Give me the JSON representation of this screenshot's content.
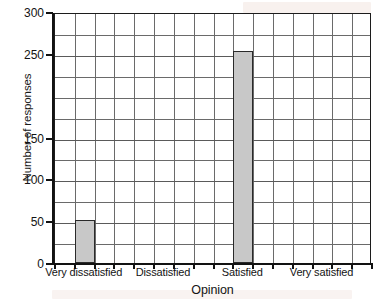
{
  "chart_data": {
    "type": "bar",
    "title": "",
    "xlabel": "Opinion",
    "ylabel": "Number of responses",
    "categories": [
      "Very dissatisfied",
      "Dissatisfied",
      "Satisfied",
      "Very satisfied"
    ],
    "values": [
      51,
      0,
      253,
      0
    ],
    "ylim": [
      0,
      300
    ],
    "y_tick_step": 25,
    "y_tick_labels": [
      "300",
      "250",
      "150",
      "100",
      "50",
      "0"
    ],
    "y_tick_label_values": [
      300,
      250,
      150,
      100,
      50,
      0
    ],
    "grid": true,
    "grid_columns": 16,
    "grid_rows": 12,
    "legend": "none",
    "bar_fill_color": "#c8c8c8",
    "bar_edge_color": "#2a2a2a",
    "grid_line_color": "#6a6a6a",
    "axis_color": "#121212",
    "background_color": "#ffffff"
  },
  "axes": {
    "y": {
      "title": "Number of responses",
      "ticks": [
        {
          "label": "300",
          "value": 300
        },
        {
          "label": "250",
          "value": 250
        },
        {
          "label": "150",
          "value": 150
        },
        {
          "label": "100",
          "value": 100
        },
        {
          "label": "50",
          "value": 50
        },
        {
          "label": "0",
          "value": 0
        }
      ]
    },
    "x": {
      "title": "Opinion",
      "ticks": [
        {
          "label": "Very dissatisfied",
          "index": 0
        },
        {
          "label": "Dissatisfied",
          "index": 1
        },
        {
          "label": "Satisfied",
          "index": 2
        },
        {
          "label": "Very satisfied",
          "index": 3
        }
      ]
    }
  },
  "bars": [
    {
      "category": "Very dissatisfied",
      "value": 51
    },
    {
      "category": "Dissatisfied",
      "value": 0
    },
    {
      "category": "Satisfied",
      "value": 253
    },
    {
      "category": "Very satisfied",
      "value": 0
    }
  ]
}
